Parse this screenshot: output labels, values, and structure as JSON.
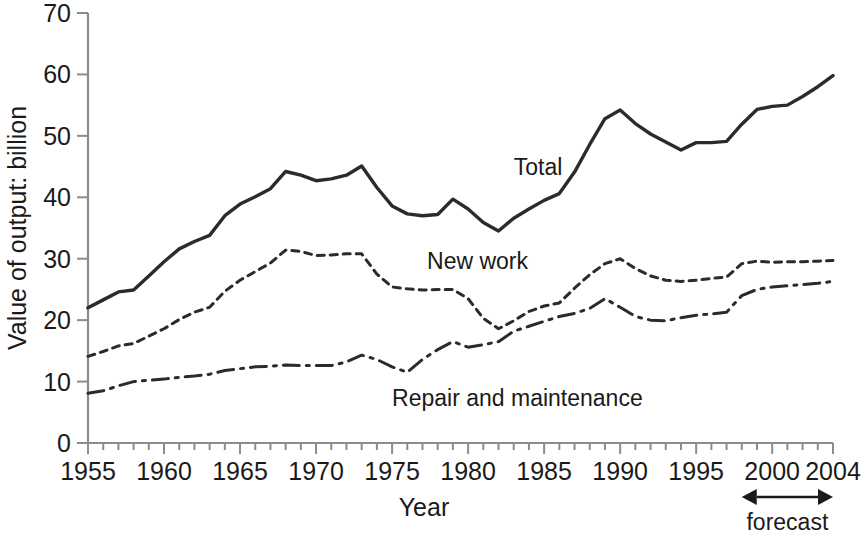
{
  "chart_data": {
    "type": "line",
    "title": "",
    "xlabel": "Year",
    "ylabel": "Value of output: billion",
    "xlim": [
      1955,
      2004
    ],
    "ylim": [
      0,
      70
    ],
    "ytick_step": 10,
    "xtick_step": 1,
    "xtick_label_step": 5,
    "grid": false,
    "legend_position": "inline-labels",
    "ytick_labels": [
      "0",
      "10",
      "20",
      "30",
      "40",
      "50",
      "60",
      "70"
    ],
    "ytick_values": [
      0,
      10,
      20,
      30,
      40,
      50,
      60,
      70
    ],
    "xtick_labels": [
      "1955",
      "1960",
      "1965",
      "1970",
      "1975",
      "1980",
      "1985",
      "1990",
      "1995",
      "2000",
      "2004"
    ],
    "xtick_values": [
      1955,
      1960,
      1965,
      1970,
      1975,
      1980,
      1985,
      1990,
      1995,
      2000,
      2004
    ],
    "x": [
      1955,
      1956,
      1957,
      1958,
      1959,
      1960,
      1961,
      1962,
      1963,
      1964,
      1965,
      1966,
      1967,
      1968,
      1969,
      1970,
      1971,
      1972,
      1973,
      1974,
      1975,
      1976,
      1977,
      1978,
      1979,
      1980,
      1981,
      1982,
      1983,
      1984,
      1985,
      1986,
      1987,
      1988,
      1989,
      1990,
      1991,
      1992,
      1993,
      1994,
      1995,
      1996,
      1997,
      1998,
      1999,
      2000,
      2001,
      2002,
      2003,
      2004
    ],
    "series": [
      {
        "name": "Total",
        "style": "solid",
        "label_x": 1983.0,
        "label_y": 43.6,
        "values": [
          22.0,
          23.3,
          24.6,
          24.9,
          27.2,
          29.5,
          31.6,
          32.8,
          33.8,
          37.0,
          38.9,
          40.1,
          41.4,
          44.2,
          43.6,
          42.7,
          43.0,
          43.6,
          45.1,
          41.6,
          38.6,
          37.3,
          37.0,
          37.2,
          39.7,
          38.1,
          35.9,
          34.5,
          36.6,
          38.1,
          39.5,
          40.6,
          44.1,
          48.6,
          52.8,
          54.2,
          52.0,
          50.3,
          49.0,
          47.7,
          48.9,
          48.9,
          49.1,
          51.9,
          54.3,
          54.8,
          55.0,
          56.4,
          58.0,
          59.8
        ]
      },
      {
        "name": "New work",
        "style": "dotted",
        "label_x": 1977.3,
        "label_y": 28.3,
        "values": [
          14.1,
          14.9,
          15.8,
          16.2,
          17.4,
          18.6,
          20.1,
          21.3,
          22.1,
          24.7,
          26.5,
          27.9,
          29.3,
          31.4,
          31.2,
          30.5,
          30.6,
          30.8,
          30.8,
          27.5,
          25.4,
          25.1,
          24.9,
          25.0,
          25.0,
          23.5,
          20.3,
          18.6,
          19.9,
          21.4,
          22.3,
          22.8,
          25.2,
          27.4,
          29.2,
          30.0,
          28.4,
          27.2,
          26.5,
          26.3,
          26.5,
          26.8,
          27.0,
          29.2,
          29.6,
          29.4,
          29.5,
          29.5,
          29.6,
          29.7
        ]
      },
      {
        "name": "Repair and maintenance",
        "style": "dash-dot",
        "label_x": 1975.0,
        "label_y": 6.1,
        "values": [
          8.1,
          8.5,
          9.3,
          10.0,
          10.2,
          10.4,
          10.7,
          10.9,
          11.2,
          11.8,
          12.1,
          12.4,
          12.5,
          12.7,
          12.6,
          12.6,
          12.6,
          13.2,
          14.3,
          13.6,
          12.4,
          11.5,
          13.6,
          15.2,
          16.5,
          15.6,
          16.0,
          16.5,
          18.2,
          19.0,
          19.8,
          20.6,
          21.1,
          21.9,
          23.5,
          22.1,
          20.6,
          20.0,
          19.9,
          20.4,
          20.8,
          21.0,
          21.3,
          24.0,
          25.0,
          25.4,
          25.6,
          25.8,
          26.0,
          26.3
        ]
      }
    ],
    "annotations": [
      {
        "name": "forecast",
        "text": "forecast",
        "x_start": 1998.0,
        "x_end": 2004.0,
        "label_x": 2001.0
      }
    ]
  }
}
